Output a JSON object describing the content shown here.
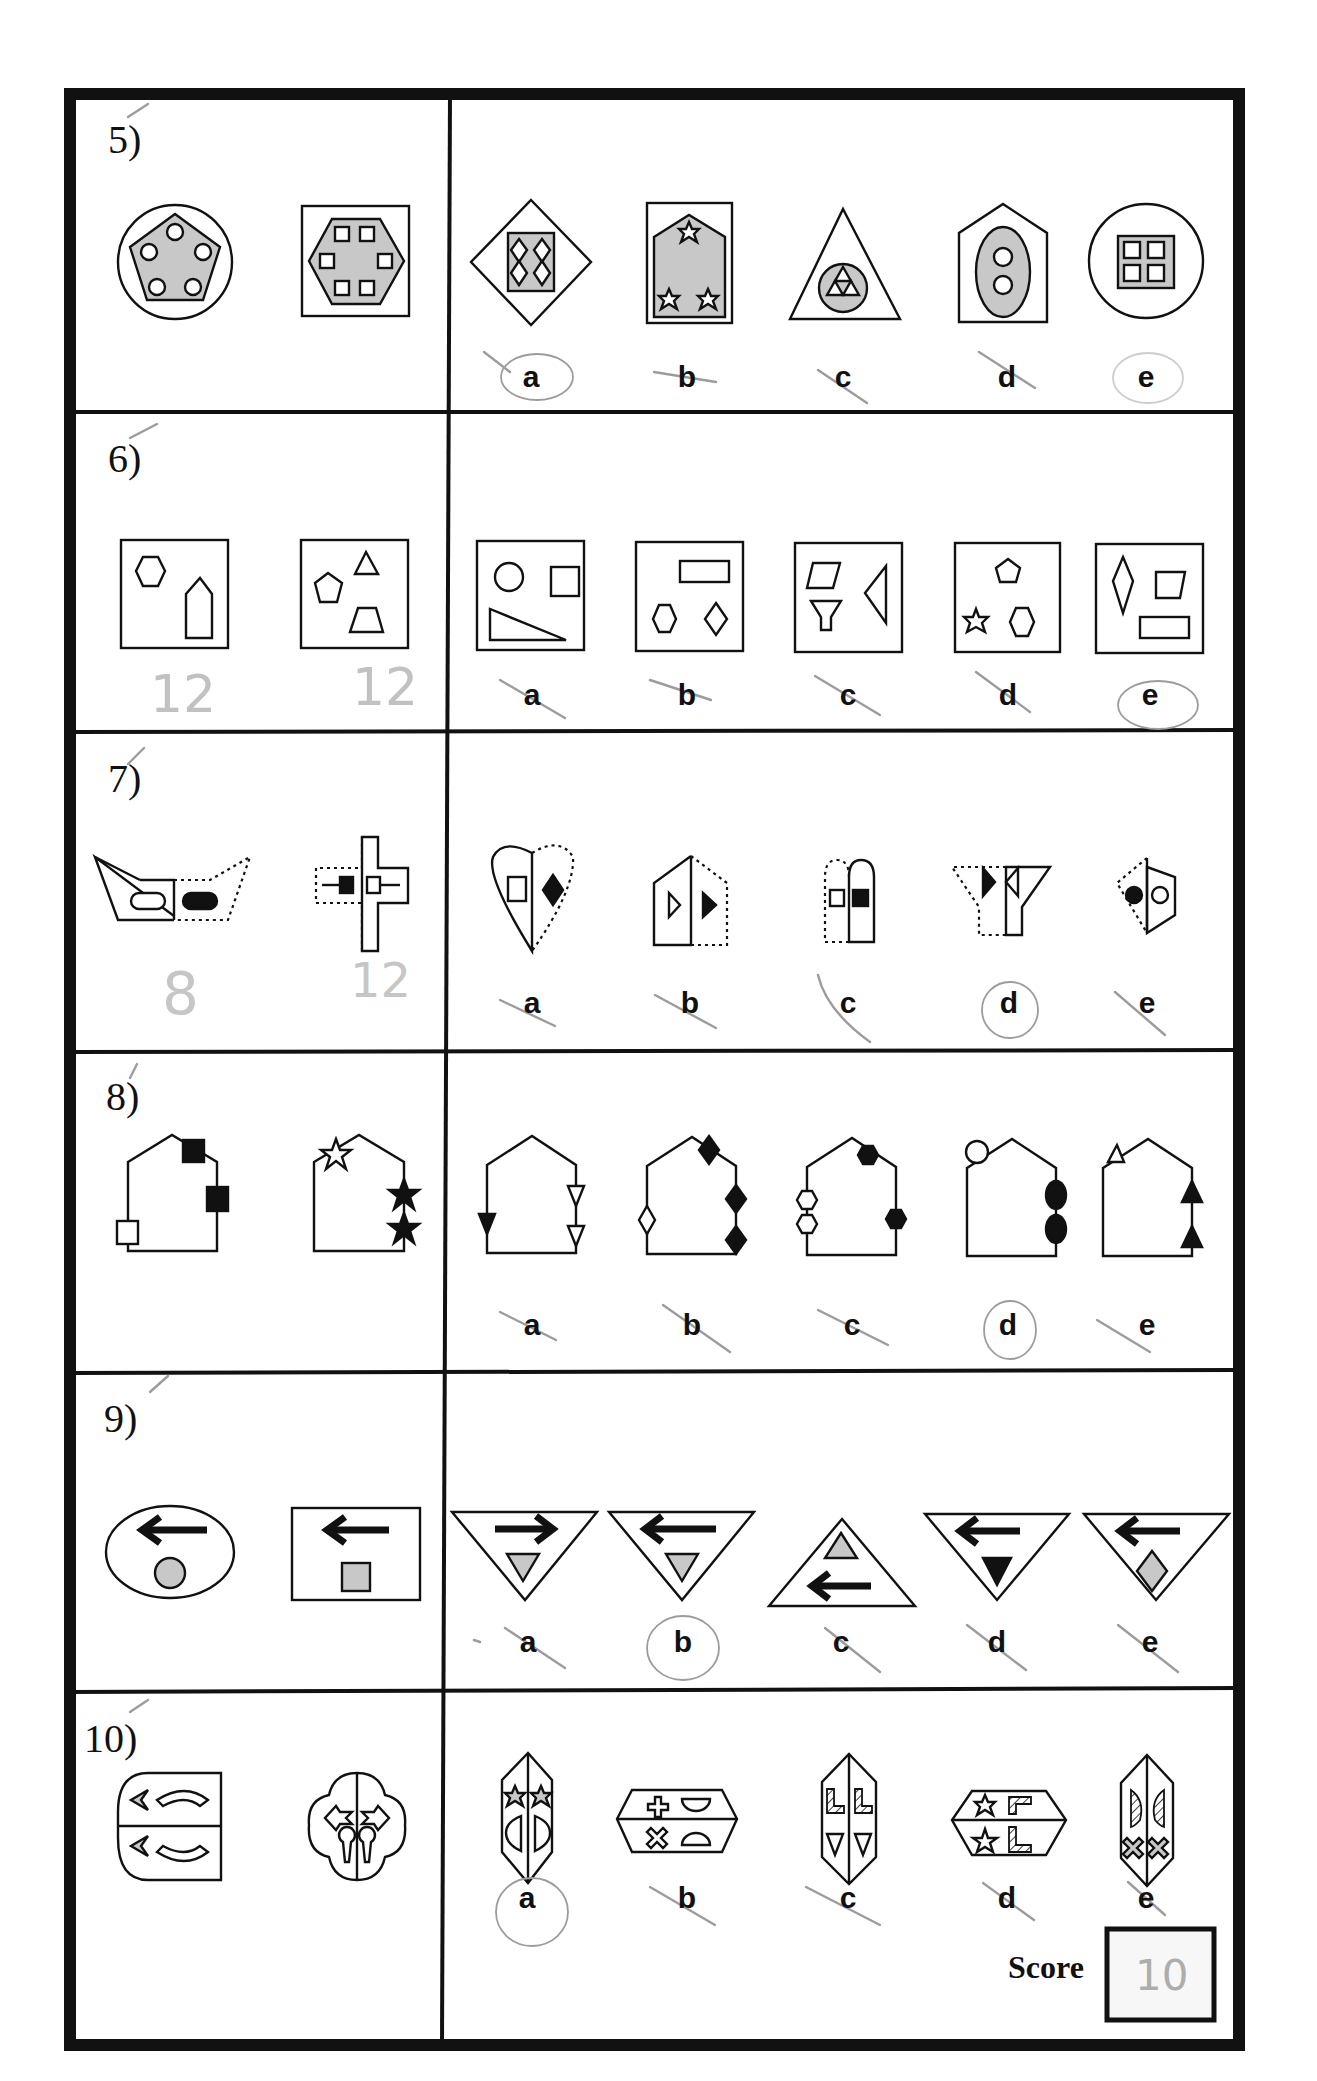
{
  "worksheet": {
    "questions": [
      {
        "number": "5)",
        "examples": [
          "circle-pentagon-five-circles",
          "square-hexagon-six-squares"
        ],
        "options": [
          {
            "letter": "a",
            "figure": "diamond-square-four-diamonds",
            "mark": "circled"
          },
          {
            "letter": "b",
            "figure": "rectangle-pentagon-three-stars",
            "mark": "crossed"
          },
          {
            "letter": "c",
            "figure": "triangle-circle-three-triangles",
            "mark": "crossed"
          },
          {
            "letter": "d",
            "figure": "pentagon-ellipse-two-circles",
            "mark": "crossed"
          },
          {
            "letter": "e",
            "figure": "circle-square-four-squares",
            "mark": "circled-faint"
          }
        ],
        "hand_notes": []
      },
      {
        "number": "6)",
        "examples": [
          "box-hexagon-pentagon",
          "box-pentagon-triangle-trapezoid"
        ],
        "options": [
          {
            "letter": "a",
            "figure": "box-circle-square-triangle",
            "mark": "crossed"
          },
          {
            "letter": "b",
            "figure": "box-rectangle-hexagon-diamond",
            "mark": "crossed"
          },
          {
            "letter": "c",
            "figure": "box-parallelogram-triangle-trapezoid",
            "mark": "crossed"
          },
          {
            "letter": "d",
            "figure": "box-pentagon-star-hexagon",
            "mark": "crossed"
          },
          {
            "letter": "e",
            "figure": "box-kite-trapezoid-rectangle",
            "mark": "circled"
          }
        ],
        "hand_notes": [
          "12",
          "12"
        ]
      },
      {
        "number": "7)",
        "examples": [
          "half-dotted-boat-rounded-rects",
          "half-dotted-cross-squares"
        ],
        "options": [
          {
            "letter": "a",
            "figure": "half-dotted-heart-square-diamond",
            "mark": "crossed"
          },
          {
            "letter": "b",
            "figure": "half-dotted-house-triangles",
            "mark": "crossed"
          },
          {
            "letter": "c",
            "figure": "half-dotted-arch-squares",
            "mark": "crossed"
          },
          {
            "letter": "d",
            "figure": "half-dotted-y-triangles",
            "mark": "circled"
          },
          {
            "letter": "e",
            "figure": "half-dotted-trapezoid-circles",
            "mark": "crossed"
          }
        ],
        "hand_notes": [
          "8",
          "12"
        ]
      },
      {
        "number": "8)",
        "examples": [
          "house-three-squares",
          "house-three-stars"
        ],
        "options": [
          {
            "letter": "a",
            "figure": "house-three-triangles",
            "mark": "crossed"
          },
          {
            "letter": "b",
            "figure": "house-four-diamonds",
            "mark": "crossed"
          },
          {
            "letter": "c",
            "figure": "house-four-hexagons",
            "mark": "crossed"
          },
          {
            "letter": "d",
            "figure": "house-three-circles",
            "mark": "circled"
          },
          {
            "letter": "e",
            "figure": "house-three-triangles-up",
            "mark": "crossed"
          }
        ],
        "hand_notes": []
      },
      {
        "number": "9)",
        "examples": [
          "ellipse-left-arrow-grey-circle",
          "rectangle-left-arrow-grey-square"
        ],
        "options": [
          {
            "letter": "a",
            "figure": "down-triangle-right-arrow-grey-triangle",
            "mark": "crossed"
          },
          {
            "letter": "b",
            "figure": "down-triangle-left-arrow-grey-triangle",
            "mark": "circled"
          },
          {
            "letter": "c",
            "figure": "up-triangle-grey-triangle-left-arrow",
            "mark": "crossed"
          },
          {
            "letter": "d",
            "figure": "down-triangle-left-arrow-black-triangle",
            "mark": "crossed"
          },
          {
            "letter": "e",
            "figure": "down-triangle-left-arrow-grey-diamond",
            "mark": "crossed"
          }
        ],
        "hand_notes": []
      },
      {
        "number": "10)",
        "examples": [
          "split-shield-chevrons-arcs",
          "split-cloud-arrows-keyholes"
        ],
        "options": [
          {
            "letter": "a",
            "figure": "split-hexagon-stars-half-circles",
            "mark": "circled"
          },
          {
            "letter": "b",
            "figure": "split-hexagon-crosses-half-circles",
            "mark": "crossed"
          },
          {
            "letter": "c",
            "figure": "split-hexagon-l-shapes-triangles",
            "mark": "crossed"
          },
          {
            "letter": "d",
            "figure": "split-hexagon-stars-l-shapes",
            "mark": "crossed"
          },
          {
            "letter": "e",
            "figure": "split-hexagon-hatched-halves-crosses",
            "mark": "crossed"
          }
        ],
        "hand_notes": []
      }
    ],
    "score": {
      "label": "Score",
      "value": "10"
    }
  },
  "colors": {
    "ink": "#111111",
    "shade": "#c8c8c8",
    "pencil": "#9c9c9c"
  }
}
